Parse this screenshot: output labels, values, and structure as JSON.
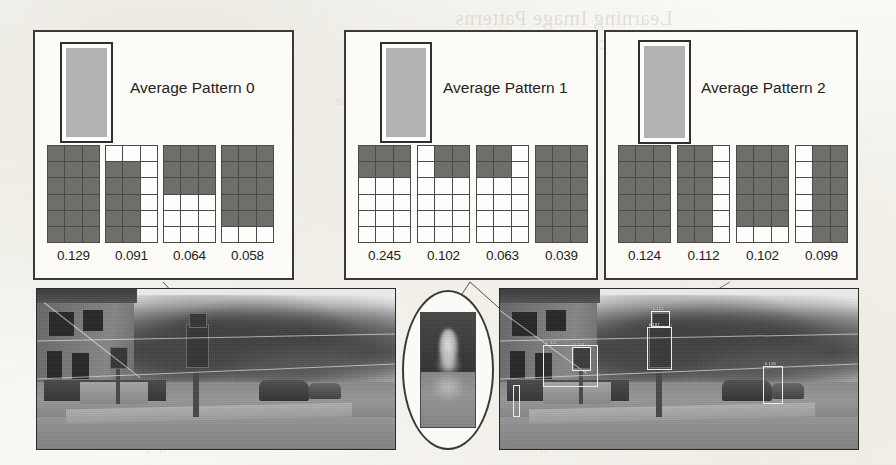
{
  "figure": {
    "kind": "pattern-panels-with-photos",
    "panels": [
      {
        "id": "panel-0",
        "title": "Average Pattern 0",
        "average_swatch_color": "#b3b3b1",
        "patterns": [
          {
            "value": "0.129",
            "cells": [
              [
                1,
                1,
                1
              ],
              [
                1,
                1,
                1
              ],
              [
                1,
                1,
                1
              ],
              [
                1,
                1,
                1
              ],
              [
                1,
                1,
                1
              ],
              [
                1,
                1,
                1
              ]
            ]
          },
          {
            "value": "0.091",
            "cells": [
              [
                0,
                0,
                0
              ],
              [
                1,
                1,
                0
              ],
              [
                1,
                1,
                0
              ],
              [
                1,
                1,
                0
              ],
              [
                1,
                1,
                0
              ],
              [
                1,
                1,
                0
              ]
            ]
          },
          {
            "value": "0.064",
            "cells": [
              [
                1,
                1,
                1
              ],
              [
                1,
                1,
                1
              ],
              [
                1,
                1,
                1
              ],
              [
                0,
                0,
                0
              ],
              [
                0,
                0,
                0
              ],
              [
                0,
                0,
                0
              ]
            ]
          },
          {
            "value": "0.058",
            "cells": [
              [
                1,
                1,
                1
              ],
              [
                1,
                1,
                1
              ],
              [
                1,
                1,
                1
              ],
              [
                1,
                1,
                1
              ],
              [
                1,
                1,
                1
              ],
              [
                0,
                0,
                0
              ]
            ]
          }
        ]
      },
      {
        "id": "panel-1",
        "title": "Average Pattern 1",
        "average_swatch_color": "#b3b3b1",
        "patterns": [
          {
            "value": "0.245",
            "cells": [
              [
                1,
                1,
                1
              ],
              [
                1,
                1,
                1
              ],
              [
                0,
                0,
                0
              ],
              [
                0,
                0,
                0
              ],
              [
                0,
                0,
                0
              ],
              [
                0,
                0,
                0
              ]
            ]
          },
          {
            "value": "0.102",
            "cells": [
              [
                0,
                1,
                1
              ],
              [
                0,
                1,
                1
              ],
              [
                0,
                0,
                0
              ],
              [
                0,
                0,
                0
              ],
              [
                0,
                0,
                0
              ],
              [
                0,
                0,
                0
              ]
            ]
          },
          {
            "value": "0.063",
            "cells": [
              [
                1,
                1,
                0
              ],
              [
                1,
                1,
                0
              ],
              [
                0,
                0,
                0
              ],
              [
                0,
                0,
                0
              ],
              [
                0,
                0,
                0
              ],
              [
                0,
                0,
                0
              ]
            ]
          },
          {
            "value": "0.039",
            "cells": [
              [
                1,
                1,
                1
              ],
              [
                1,
                1,
                1
              ],
              [
                1,
                1,
                1
              ],
              [
                1,
                1,
                1
              ],
              [
                1,
                1,
                1
              ],
              [
                1,
                1,
                1
              ]
            ]
          }
        ]
      },
      {
        "id": "panel-2",
        "title": "Average Pattern 2",
        "average_swatch_color": "#b3b3b1",
        "patterns": [
          {
            "value": "0.124",
            "cells": [
              [
                1,
                1,
                1
              ],
              [
                1,
                1,
                1
              ],
              [
                1,
                1,
                1
              ],
              [
                1,
                1,
                1
              ],
              [
                1,
                1,
                1
              ],
              [
                1,
                1,
                1
              ]
            ]
          },
          {
            "value": "0.112",
            "cells": [
              [
                1,
                1,
                0
              ],
              [
                1,
                1,
                0
              ],
              [
                1,
                1,
                0
              ],
              [
                1,
                1,
                0
              ],
              [
                1,
                1,
                0
              ],
              [
                1,
                1,
                0
              ]
            ]
          },
          {
            "value": "0.102",
            "cells": [
              [
                1,
                1,
                1
              ],
              [
                1,
                1,
                1
              ],
              [
                1,
                1,
                1
              ],
              [
                1,
                1,
                1
              ],
              [
                1,
                1,
                1
              ],
              [
                0,
                0,
                0
              ]
            ]
          },
          {
            "value": "0.099",
            "cells": [
              [
                0,
                1,
                1
              ],
              [
                0,
                1,
                1
              ],
              [
                0,
                1,
                1
              ],
              [
                0,
                1,
                1
              ],
              [
                0,
                1,
                1
              ],
              [
                0,
                1,
                1
              ]
            ]
          }
        ]
      }
    ],
    "photos": [
      {
        "id": "photo-left",
        "caption": "",
        "scene": "street-corner-with-building-trees-and-traffic-signal",
        "has_detection_boxes": false
      },
      {
        "id": "photo-right",
        "caption": "",
        "scene": "street-corner-with-building-trees-and-traffic-signal",
        "has_detection_boxes": true,
        "detection_labels": [
          "0.197",
          "0.122",
          "0.113",
          "0.342",
          "0.128"
        ]
      }
    ],
    "callout": {
      "id": "oval-callout",
      "shape": "ellipse",
      "content": "magnified-blurry-crop"
    }
  },
  "bleedthrough": {
    "title": "Learning Image Patterns",
    "subtitle": "for Object Detection",
    "small1": "reverse",
    "small2": "pattern",
    "small3": "features",
    "foot1": "and the average pattern",
    "foot2": "over the training set",
    "right1": "1 2 3 4 5 6 7"
  }
}
